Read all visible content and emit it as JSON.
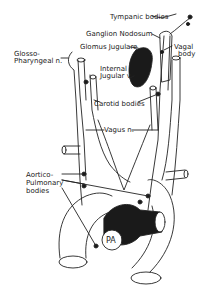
{
  "colors": {
    "line": "#222222",
    "fill": "#1a1a1a",
    "background": "#ffffff"
  },
  "labels": {
    "tympanic": "Tympanic bodies",
    "ganglion": "Ganglion Nodosum",
    "glomus": "Glomus Jugulare",
    "vagal1": "Vagal",
    "vagal2": "body",
    "glosso1": "Glosso-",
    "glosso2": "Pharyngeal n.",
    "internal1": "Internal",
    "internal2": "Jugular v.",
    "carotid": "Carotid bodies",
    "vagus": "Vagus n.",
    "aortico1": "Aortico-",
    "aortico2": "Pulmonary",
    "aortico3": "bodies",
    "pa": "PA"
  }
}
